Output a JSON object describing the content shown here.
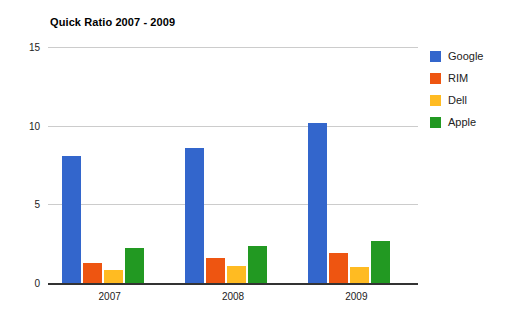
{
  "chart_data": {
    "type": "bar",
    "title": "Quick Ratio 2007 - 2009",
    "xlabel": "",
    "ylabel": "",
    "categories": [
      "2007",
      "2008",
      "2009"
    ],
    "series": [
      {
        "name": "Google",
        "color": "#3366cc",
        "values": [
          8.1,
          8.6,
          10.2
        ]
      },
      {
        "name": "RIM",
        "color": "#ee5511",
        "values": [
          1.3,
          1.6,
          1.9
        ]
      },
      {
        "name": "Dell",
        "color": "#ffbb22",
        "values": [
          0.8,
          1.1,
          1.0
        ]
      },
      {
        "name": "Apple",
        "color": "#229922",
        "values": [
          2.2,
          2.35,
          2.65
        ]
      }
    ],
    "ylim": [
      0,
      15
    ],
    "y_ticks": [
      0,
      5,
      10,
      15
    ],
    "y_tick_labels": [
      "0",
      "5",
      "10",
      "15"
    ],
    "grid": true,
    "legend_position": "right",
    "grid_color": "#cccccc",
    "axis_color": "#333333",
    "background": "#ffffff"
  }
}
